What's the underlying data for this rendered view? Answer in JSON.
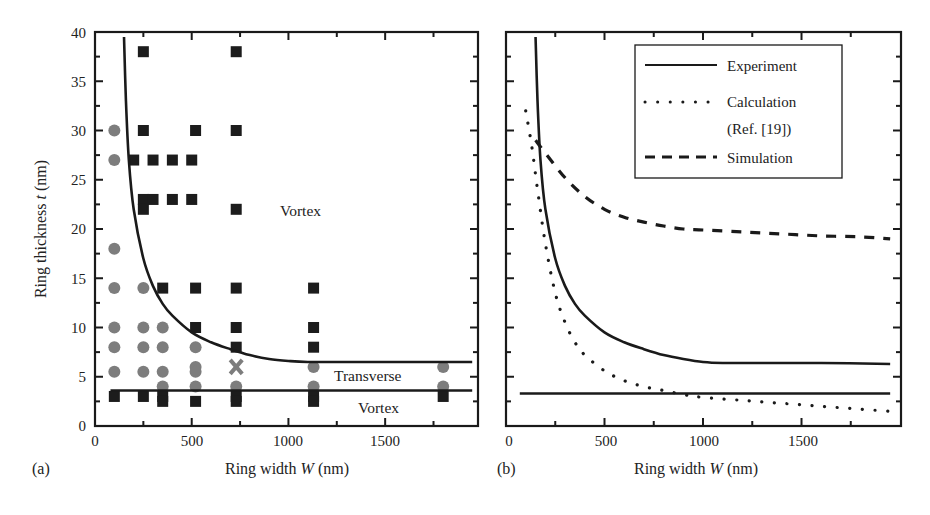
{
  "chart_data": [
    {
      "panel": "(a)",
      "type": "scatter",
      "title": "",
      "xlabel": "Ring width W (nm)",
      "ylabel": "Ring thickness t (nm)",
      "xlim": [
        0,
        2000
      ],
      "ylim": [
        0,
        40
      ],
      "xticks": [
        0,
        500,
        1000,
        1500
      ],
      "yticks": [
        0,
        5,
        10,
        15,
        20,
        25,
        30,
        35,
        40
      ],
      "grid": false,
      "region_labels": [
        {
          "text": "Vortex",
          "x": 1300,
          "y": 21.5
        },
        {
          "text": "Transverse",
          "x": 1420,
          "y": 4.9
        },
        {
          "text": "Vortex",
          "x": 1420,
          "y": 1.3
        }
      ],
      "series": [
        {
          "name": "Vortex state (squares)",
          "marker": "square",
          "color": "#1c1c1c",
          "points": [
            [
              100,
              3
            ],
            [
              250,
              38
            ],
            [
              250,
              30
            ],
            [
              200,
              27
            ],
            [
              250,
              23
            ],
            [
              250,
              22
            ],
            [
              250,
              3
            ],
            [
              300,
              27
            ],
            [
              300,
              23
            ],
            [
              350,
              14
            ],
            [
              350,
              3
            ],
            [
              350,
              2.5
            ],
            [
              400,
              27
            ],
            [
              400,
              23
            ],
            [
              500,
              27
            ],
            [
              500,
              23
            ],
            [
              520,
              30
            ],
            [
              520,
              14
            ],
            [
              520,
              10
            ],
            [
              520,
              2.5
            ],
            [
              730,
              38
            ],
            [
              730,
              30
            ],
            [
              730,
              22
            ],
            [
              730,
              14
            ],
            [
              730,
              10
            ],
            [
              730,
              8
            ],
            [
              730,
              3
            ],
            [
              730,
              2.5
            ],
            [
              1130,
              14
            ],
            [
              1130,
              10
            ],
            [
              1130,
              8
            ],
            [
              1130,
              3
            ],
            [
              1130,
              2.5
            ],
            [
              1800,
              3
            ]
          ]
        },
        {
          "name": "Onion/transverse state (circles)",
          "marker": "circle",
          "color": "#7d7d7d",
          "points": [
            [
              100,
              30
            ],
            [
              100,
              27
            ],
            [
              100,
              18
            ],
            [
              100,
              14
            ],
            [
              100,
              10
            ],
            [
              100,
              8
            ],
            [
              100,
              5.5
            ],
            [
              250,
              14
            ],
            [
              250,
              10
            ],
            [
              250,
              8
            ],
            [
              250,
              5.5
            ],
            [
              350,
              10
            ],
            [
              350,
              8
            ],
            [
              350,
              5.5
            ],
            [
              350,
              4
            ],
            [
              520,
              8
            ],
            [
              520,
              6
            ],
            [
              520,
              5.5
            ],
            [
              520,
              4
            ],
            [
              730,
              4
            ],
            [
              1130,
              6
            ],
            [
              1130,
              4
            ],
            [
              1800,
              6
            ],
            [
              1800,
              4
            ]
          ]
        },
        {
          "name": "Mixed state (cross)",
          "marker": "x",
          "color": "#7d7d7d",
          "points": [
            [
              730,
              6
            ]
          ]
        },
        {
          "name": "Upper boundary (experiment)",
          "type": "line",
          "color": "#1a1a1a",
          "x": [
            150,
            160,
            175,
            200,
            250,
            300,
            350,
            400,
            500,
            600,
            700,
            800,
            900,
            1000,
            1100,
            1300,
            1600,
            1950
          ],
          "values": [
            39.5,
            33,
            27,
            22,
            17,
            14.2,
            12.4,
            11.2,
            9.5,
            8.5,
            7.8,
            7.2,
            6.8,
            6.6,
            6.5,
            6.5,
            6.5,
            6.5
          ]
        },
        {
          "name": "Lower boundary (experiment)",
          "type": "line",
          "color": "#1a1a1a",
          "x": [
            80,
            1950
          ],
          "values": [
            3.6,
            3.6
          ]
        }
      ]
    },
    {
      "panel": "(b)",
      "type": "line",
      "title": "",
      "xlabel": "Ring width W (nm)",
      "ylabel": "",
      "xlim": [
        0,
        2000
      ],
      "ylim": [
        0,
        40
      ],
      "xticks": [
        0,
        500,
        1000,
        1500
      ],
      "grid": false,
      "legend_position": "upper right (inside)",
      "legend": [
        "Experiment",
        "Calculation (Ref. [19])",
        "Simulation"
      ],
      "series": [
        {
          "name": "Experiment",
          "style": "solid",
          "x": [
            150,
            160,
            175,
            200,
            250,
            300,
            350,
            400,
            500,
            600,
            700,
            800,
            900,
            1000,
            1100,
            1300,
            1600,
            1950
          ],
          "values": [
            39.5,
            33,
            27,
            22,
            17,
            14.2,
            12.4,
            11.2,
            9.5,
            8.5,
            7.8,
            7.2,
            6.8,
            6.5,
            6.4,
            6.4,
            6.4,
            6.3
          ]
        },
        {
          "name": "Experiment (lower boundary)",
          "style": "solid",
          "x": [
            70,
            1950
          ],
          "values": [
            3.3,
            3.3
          ]
        },
        {
          "name": "Calculation (Ref. [19])",
          "style": "dotted",
          "x": [
            100,
            130,
            160,
            200,
            250,
            300,
            350,
            400,
            500,
            600,
            700,
            800,
            900,
            1000,
            1200,
            1400,
            1600,
            1800,
            1950
          ],
          "values": [
            32,
            28.5,
            24,
            18.5,
            13.5,
            10.5,
            8.5,
            7.2,
            5.6,
            4.6,
            4.0,
            3.6,
            3.2,
            2.9,
            2.6,
            2.3,
            2.0,
            1.7,
            1.5
          ]
        },
        {
          "name": "Simulation",
          "style": "dashed",
          "x": [
            150,
            200,
            300,
            400,
            500,
            600,
            700,
            800,
            900,
            1000,
            1200,
            1400,
            1600,
            1800,
            1950
          ],
          "values": [
            29,
            27.7,
            25.2,
            23.3,
            22.0,
            21.2,
            20.7,
            20.3,
            20.0,
            19.9,
            19.7,
            19.5,
            19.3,
            19.2,
            19.0
          ]
        }
      ]
    }
  ],
  "panels": {
    "a": {
      "label": "(a)",
      "xlabel_prefix": "Ring width ",
      "xlabel_var": "W",
      "xlabel_unit": " (nm)",
      "ylabel_prefix": "Ring thickness ",
      "ylabel_var": "t",
      "ylabel_unit": " (nm)",
      "xtick_labels": [
        "0",
        "500",
        "1000",
        "1500"
      ],
      "ytick_labels": [
        "0",
        "5",
        "10",
        "15",
        "20",
        "25",
        "30",
        "35",
        "40"
      ],
      "region_vortex_top": "Vortex",
      "region_transverse": "Transverse",
      "region_vortex_bottom": "Vortex"
    },
    "b": {
      "label": "(b)",
      "xlabel_prefix": "Ring width ",
      "xlabel_var": "W",
      "xlabel_unit": " (nm)",
      "xtick_labels": [
        "0",
        "500",
        "1000",
        "1500"
      ],
      "legend": {
        "experiment": "Experiment",
        "calculation_line1": "Calculation",
        "calculation_line2": "(Ref. [19])",
        "simulation": "Simulation"
      }
    }
  },
  "colors": {
    "ink": "#1a1a1a",
    "square_marker": "#1c1c1c",
    "circle_marker": "#7d7d7d"
  }
}
